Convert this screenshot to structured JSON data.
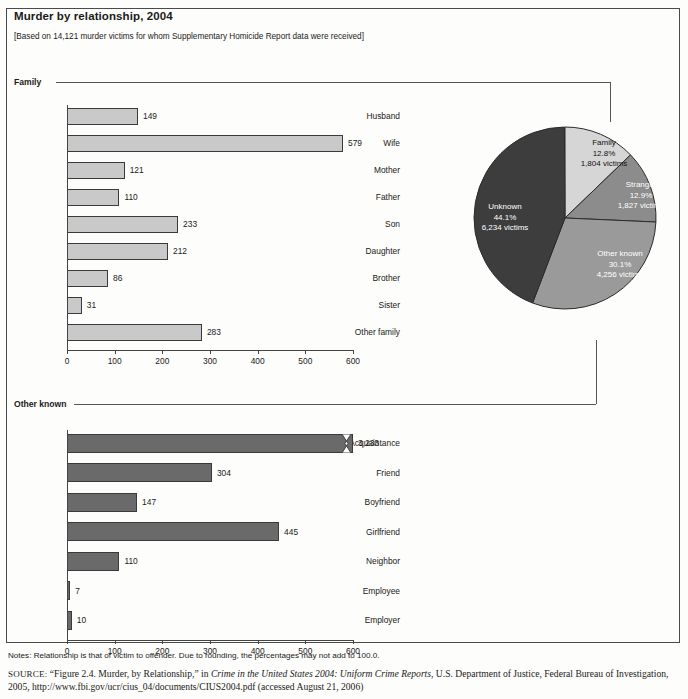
{
  "title": "Murder by relationship, 2004",
  "subtitle": "[Based on 14,121 murder victims for whom Supplementary Homicide Report data were received]",
  "sections": {
    "family_label": "Family",
    "other_known_label": "Other known"
  },
  "chart_data": [
    {
      "type": "bar",
      "orientation": "horizontal",
      "name": "Family",
      "title": "Family",
      "xlabel": "",
      "ylabel": "",
      "xlim": [
        0,
        600
      ],
      "ticks": [
        0,
        100,
        200,
        300,
        400,
        500,
        600
      ],
      "tick_labels": [
        "0",
        "100",
        "200",
        "300",
        "400",
        "500",
        "600"
      ],
      "grid": false,
      "bar_color": "#c9c9c9",
      "categories": [
        "Husband",
        "Wife",
        "Mother",
        "Father",
        "Son",
        "Daughter",
        "Brother",
        "Sister",
        "Other family"
      ],
      "values": [
        149,
        579,
        121,
        110,
        233,
        212,
        86,
        31,
        283
      ],
      "value_labels": [
        "149",
        "579",
        "121",
        "110",
        "233",
        "212",
        "86",
        "31",
        "283"
      ]
    },
    {
      "type": "bar",
      "orientation": "horizontal",
      "name": "Other known",
      "title": "Other known",
      "xlabel": "",
      "ylabel": "",
      "xlim": [
        0,
        600
      ],
      "ticks": [
        0,
        100,
        200,
        300,
        400,
        500,
        600
      ],
      "tick_labels": [
        "0",
        "100",
        "200",
        "300",
        "400",
        "500",
        "600"
      ],
      "grid": false,
      "bar_color": "#6a6a6a",
      "categories": [
        "Acquaintance",
        "Friend",
        "Boyfriend",
        "Girlfriend",
        "Neighbor",
        "Employee",
        "Employer"
      ],
      "values": [
        3233,
        304,
        147,
        445,
        110,
        7,
        10
      ],
      "value_labels": [
        "3,233",
        "304",
        "147",
        "445",
        "110",
        "7",
        "10"
      ],
      "axis_break": {
        "category": "Acquaintance",
        "note": "bar truncated with break mark at ~560"
      }
    },
    {
      "type": "pie",
      "name": "Murder victims by relationship",
      "title": "",
      "legend_position": "inside-slices",
      "total_victims": 14121,
      "slices": [
        {
          "label": "Family",
          "percent": 12.8,
          "victims": 1804,
          "victims_label": "1,804 victims",
          "percent_label": "12.8%",
          "color": "#d6d6d6"
        },
        {
          "label": "Stranger",
          "percent": 12.9,
          "victims": 1827,
          "victims_label": "1,827 victims",
          "percent_label": "12.9%",
          "color": "#8c8c8c"
        },
        {
          "label": "Other known",
          "percent": 30.1,
          "victims": 4256,
          "victims_label": "4,256 victims",
          "percent_label": "30.1%",
          "color": "#9a9a9a"
        },
        {
          "label": "Unknown",
          "percent": 44.1,
          "victims": 6234,
          "victims_label": "6,234 victims",
          "percent_label": "44.1%",
          "color": "#3d3d3d"
        }
      ]
    }
  ],
  "pie_labels": {
    "family": {
      "name": "Family",
      "pct": "12.8%",
      "victims": "1,804 victims"
    },
    "stranger": {
      "name": "Stranger",
      "pct": "12.9%",
      "victims": "1,827 victims"
    },
    "other_known": {
      "name": "Other known",
      "pct": "30.1%",
      "victims": "4,256 victims"
    },
    "unknown": {
      "name": "Unknown",
      "pct": "44.1%",
      "victims": "6,234 victims"
    }
  },
  "notes": "Notes: Relationship is that of victim to offender. Due to rounding, the percentages may not add to 100.0.",
  "source": {
    "prefix": "SOURCE:",
    "part1": " “Figure 2.4. Murder, by Relationship,” in ",
    "italic": "Crime in the United States 2004: Uniform Crime Reports",
    "part2": ", U.S. Department of Justice, Federal Bureau of Investigation, 2005, http://www.fbi.gov/ucr/cius_04/documents/CIUS2004.pdf (accessed August 21, 2006)"
  },
  "colors": {
    "bar_light": "#c9c9c9",
    "bar_dark": "#6a6a6a",
    "frame": "#4a4a4a",
    "text": "#1a1a1a"
  }
}
